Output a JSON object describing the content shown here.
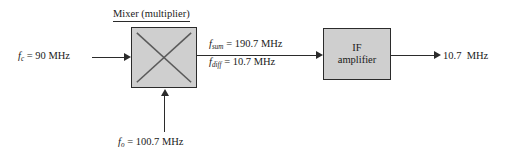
{
  "diagram": {
    "background_color": "#ffffff",
    "block_fill_color": "#cfcfcf",
    "line_color": "#2b2b2b"
  },
  "mixer": {
    "title": "Mixer (multiplier)",
    "symbol": "multiplier-x-icon"
  },
  "inputs": {
    "rf": {
      "symbol": "f",
      "subscript": "c",
      "equals": "=",
      "value": "90",
      "unit": "MHz",
      "full_text": "fc = 90 MHz"
    },
    "local_oscillator": {
      "symbol": "f",
      "subscript": "o",
      "equals": "=",
      "value": "100.7",
      "unit": "MHz",
      "full_text": "fo = 100.7 MHz"
    }
  },
  "mixer_outputs": {
    "sum": {
      "symbol": "f",
      "subscript": "sum",
      "equals": "=",
      "value": "190.7",
      "unit": "MHz",
      "full_text": "fsum = 190.7 MHz"
    },
    "difference": {
      "symbol": "f",
      "subscript": "diff",
      "equals": "=",
      "value": "10.7",
      "unit": "MHz",
      "full_text": "fdiff = 10.7 MHz"
    }
  },
  "if_amplifier": {
    "line1": "IF",
    "line2": "amplifier"
  },
  "output": {
    "value": "10.7",
    "unit": "MHz",
    "full_text": "10.7 MHz"
  }
}
